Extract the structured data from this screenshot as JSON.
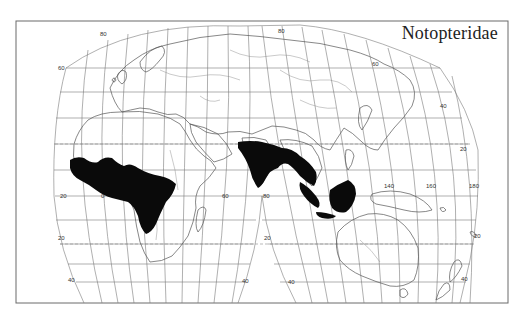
{
  "map": {
    "title": "Notopteridae",
    "projection": "interrupted world projection",
    "colors": {
      "range_fill": "#0a0a0a",
      "graticule": "#7a7a7a",
      "coastline": "#555555",
      "frame": "#6a6a6a",
      "background": "#ffffff"
    },
    "graticule_labels": {
      "latitude_left": [
        "80",
        "60",
        "20",
        "20",
        "40"
      ],
      "longitude_equator": [
        "20",
        "0",
        "60",
        "80",
        "140",
        "160",
        "180"
      ],
      "latitude_right": [
        "80",
        "60",
        "40",
        "20",
        "20",
        "40"
      ],
      "latitude_south_center": [
        "40",
        "40"
      ]
    },
    "labels": [
      {
        "id": "lat-80-left",
        "text": "80",
        "x": 100,
        "y": 36
      },
      {
        "id": "lat-60-left",
        "text": "60",
        "x": 58,
        "y": 70
      },
      {
        "id": "lon-20w",
        "text": "20",
        "x": 60,
        "y": 196
      },
      {
        "id": "lon-0",
        "text": "0",
        "x": 101,
        "y": 196
      },
      {
        "id": "lat-20s-left",
        "text": "20",
        "x": 60,
        "y": 241
      },
      {
        "id": "lat-40s-left",
        "text": "40",
        "x": 70,
        "y": 281
      },
      {
        "id": "lon-60",
        "text": "60",
        "x": 225,
        "y": 196
      },
      {
        "id": "lon-80",
        "text": "80",
        "x": 264,
        "y": 196
      },
      {
        "id": "lat-20s-center",
        "text": "20",
        "x": 264,
        "y": 239
      },
      {
        "id": "lat-40s-center-left",
        "text": "40",
        "x": 244,
        "y": 282
      },
      {
        "id": "lat-40s-center-right",
        "text": "40",
        "x": 290,
        "y": 283
      },
      {
        "id": "lat-80-top",
        "text": "80",
        "x": 280,
        "y": 33
      },
      {
        "id": "lat-60-top",
        "text": "60",
        "x": 372,
        "y": 65
      },
      {
        "id": "lat-40-right",
        "text": "40",
        "x": 441,
        "y": 107
      },
      {
        "id": "lat-20-right",
        "text": "20",
        "x": 463,
        "y": 150
      },
      {
        "id": "lon-140",
        "text": "140",
        "x": 386,
        "y": 187
      },
      {
        "id": "lon-160",
        "text": "160",
        "x": 428,
        "y": 187
      },
      {
        "id": "lon-180",
        "text": "180",
        "x": 470,
        "y": 187
      },
      {
        "id": "lat-20s-right",
        "text": "20",
        "x": 475,
        "y": 237
      },
      {
        "id": "lat-40s-right",
        "text": "40",
        "x": 463,
        "y": 280
      }
    ],
    "distribution_regions": [
      "West and Central Africa",
      "Indian subcontinent and Southeast Asia",
      "Sumatra",
      "Borneo",
      "Java"
    ]
  }
}
